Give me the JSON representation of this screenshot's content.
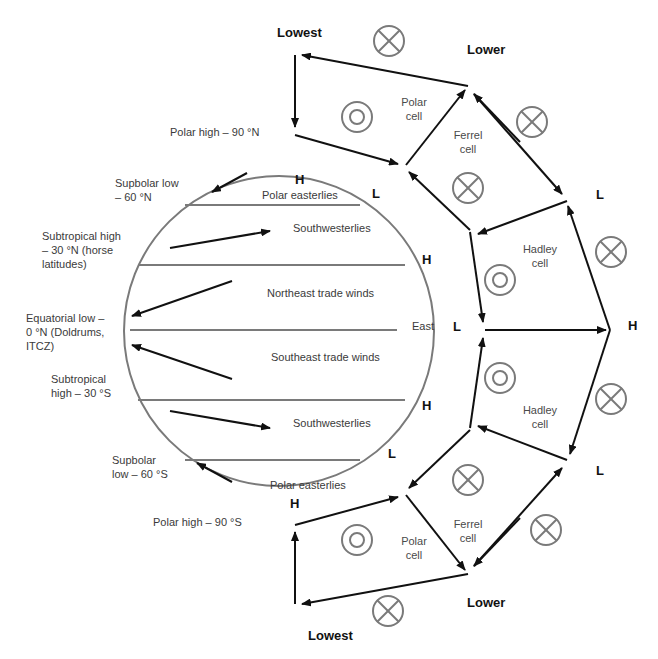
{
  "colors": {
    "arrow": "#111111",
    "earth_outline": "#7a7a7a",
    "band_line": "#7a7a7a",
    "symbol": "#7a7a7a",
    "text": "#3a3a3a"
  },
  "pressure_zone_labels": {
    "polar_high_n": "Polar high – 90 °N",
    "subpolar_low_n": [
      "Supbolar low",
      "– 60 °N"
    ],
    "subtropical_high_n": [
      "Subtropical high",
      "– 30 °N (horse",
      "latitudes)"
    ],
    "equatorial_low": [
      "Equatorial low –",
      "0 °N (Doldrums,",
      "ITCZ)"
    ],
    "subtropical_high_s": [
      "Subtropical",
      "high – 30 °S"
    ],
    "subpolar_low_s": [
      "Supbolar",
      "low – 60 °S"
    ],
    "polar_high_s": "Polar high – 90 °S"
  },
  "wind_labels": {
    "polar_easterlies_n": "Polar easterlies",
    "southwesterlies_n": "Southwesterlies",
    "ne_trades": "Northeast trade winds",
    "east": "East",
    "se_trades": "Southeast trade winds",
    "southwesterlies_s": "Southwesterlies",
    "polar_easterlies_s": "Polar easterlies"
  },
  "pressure_letters": {
    "h_pole_n": "H",
    "l_60n": "L",
    "h_30n": "H",
    "l_eq": "L",
    "h_30s": "H",
    "l_60s": "L",
    "h_pole_s": "H",
    "l_outer_n": "L",
    "h_outer_eq": "H",
    "l_outer_s": "L"
  },
  "altitude_labels": {
    "lowest_top": "Lowest",
    "lower_top": "Lower",
    "lowest_bottom": "Lowest",
    "lower_bottom": "Lower"
  },
  "cells": {
    "polar_n": [
      "Polar",
      "cell"
    ],
    "ferrel_n": [
      "Ferrel",
      "cell"
    ],
    "hadley_n": [
      "Hadley",
      "cell"
    ],
    "hadley_s": [
      "Hadley",
      "cell"
    ],
    "ferrel_s": [
      "Ferrel",
      "cell"
    ],
    "polar_s": [
      "Polar",
      "cell"
    ]
  },
  "symbols": {
    "into_page": "circle-cross (flow into page)",
    "out_of_page": "circle-dot (flow out of page)"
  }
}
